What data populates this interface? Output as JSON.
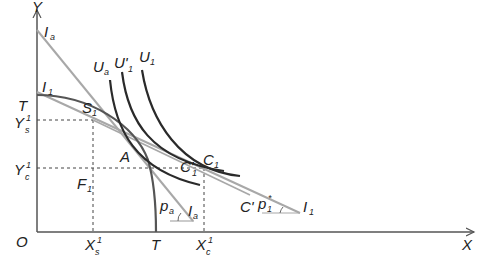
{
  "diagram": {
    "type": "economics-trade-diagram",
    "axes": {
      "x_label": "X",
      "y_label": "Y",
      "origin_label": "O"
    },
    "ppf": {
      "label_y": "T",
      "label_x": "T"
    },
    "price_lines": {
      "autarky": {
        "label": "I",
        "sub": "a",
        "slope_label": "p",
        "slope_sub": "a",
        "slope_line_label": "I",
        "slope_line_sub": "a"
      },
      "trade": {
        "label": "I",
        "sub": "1",
        "slope_label": "p",
        "slope_sub": "1",
        "slope_sup": "*",
        "end_label": "I",
        "end_sub": "1"
      }
    },
    "indifference_curves": [
      {
        "label": "U",
        "sub": "a"
      },
      {
        "label": "U'",
        "sub": "1"
      },
      {
        "label": "U",
        "sub": "1"
      }
    ],
    "points": {
      "S": {
        "label": "S",
        "sub": "1"
      },
      "A": {
        "label": "A"
      },
      "C1": {
        "label": "C",
        "sub": "1"
      },
      "C1prime": {
        "label": "C'",
        "sub": "1"
      },
      "Cprime": {
        "label": "C'"
      },
      "F": {
        "label": "F",
        "sub": "1"
      }
    },
    "tick_labels": {
      "ys": {
        "label": "Y",
        "sup": "1",
        "sub": "s"
      },
      "yc": {
        "label": "Y",
        "sup": "1",
        "sub": "c"
      },
      "xs": {
        "label": "X",
        "sup": "1",
        "sub": "s"
      },
      "xc": {
        "label": "X",
        "sup": "1",
        "sub": "c"
      }
    },
    "colors": {
      "axis": "#555555",
      "curve_dark": "#2a2a2a",
      "line_gray": "#a8a8a8",
      "dashed": "#444444"
    }
  }
}
